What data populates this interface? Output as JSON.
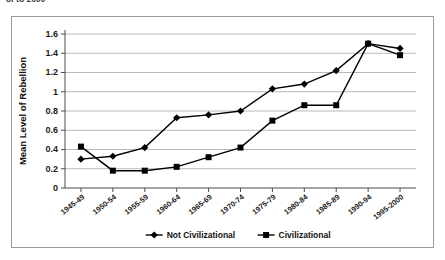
{
  "title_partial": "of to 2000",
  "chart_data": {
    "type": "line",
    "title": "",
    "xlabel": "",
    "ylabel": "Mean Level of Rebellion",
    "ylim": [
      0,
      1.6
    ],
    "ytick_labels": [
      "0",
      "0.2",
      "0.4",
      "0.6",
      "0.8",
      "1",
      "1.2",
      "1.4",
      "1.6"
    ],
    "ytick_values": [
      0,
      0.2,
      0.4,
      0.6,
      0.8,
      1.0,
      1.2,
      1.4,
      1.6
    ],
    "grid": true,
    "legend_position": "bottom",
    "categories": [
      "1945-49",
      "1950-54",
      "1955-59",
      "1960-64",
      "1965-69",
      "1970-74",
      "1975-79",
      "1980-84",
      "1985-89",
      "1990-94",
      "1995-2000"
    ],
    "series": [
      {
        "name": "Not Civilizational",
        "marker": "diamond",
        "color": "#000000",
        "values": [
          0.3,
          0.33,
          0.42,
          0.73,
          0.76,
          0.8,
          1.03,
          1.08,
          1.22,
          1.5,
          1.45
        ]
      },
      {
        "name": "Civilizational",
        "marker": "square",
        "color": "#000000",
        "values": [
          0.43,
          0.18,
          0.18,
          0.22,
          0.32,
          0.42,
          0.7,
          0.86,
          0.86,
          1.5,
          1.38
        ]
      }
    ]
  }
}
